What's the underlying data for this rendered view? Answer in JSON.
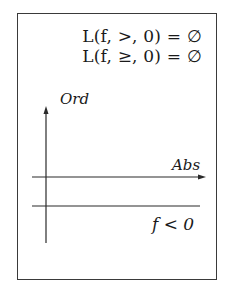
{
  "diagram": {
    "equations": [
      "L(f, >, 0) = ∅",
      "L(f, ≥, 0) = ∅"
    ],
    "y_axis_label": "Ord",
    "x_axis_label": "Abs",
    "region_label": "f < 0",
    "line_color": "#2a2a2a"
  }
}
